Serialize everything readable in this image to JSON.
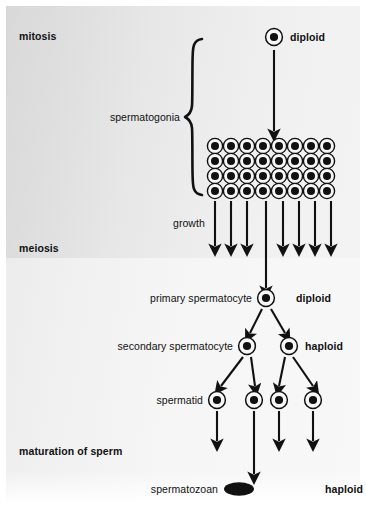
{
  "figure": {
    "background_color": "#e9e9e9",
    "ink_color": "#111111"
  },
  "stages": [
    {
      "id": "mitosis",
      "label": "mitosis"
    },
    {
      "id": "meiosis",
      "label": "meiosis"
    },
    {
      "id": "maturation",
      "label": "maturation of sperm"
    }
  ],
  "cell_labels": {
    "spermatogonia": "spermatogonia",
    "growth": "growth",
    "primary_spermatocyte": "primary spermatocyte",
    "secondary_spermatocyte": "secondary spermatocyte",
    "spermatid": "spermatid",
    "spermatozoan": "spermatozoan"
  },
  "ploidy_labels": {
    "top": "diploid",
    "primary": "diploid",
    "secondary": "haploid",
    "sperm": "haploid"
  },
  "counts": {
    "spermatogonia_grid_columns": 8,
    "spermatogonia_grid_rows": 4,
    "spermatogonia_total": 32,
    "growth_arrows": 8,
    "primary_spermatocytes": 1,
    "secondary_spermatocytes": 2,
    "spermatids": 4,
    "spermatozoa": 1
  },
  "icons": {
    "cell": "cell-with-nucleus-icon",
    "arrow": "down-arrow-icon",
    "brace": "curly-brace-icon",
    "sperm": "spermatozoan-icon"
  }
}
